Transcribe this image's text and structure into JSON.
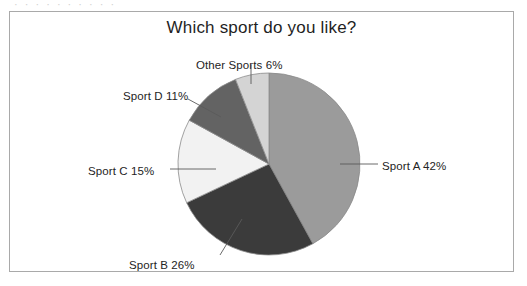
{
  "artifact_text": "· · · · · · · · · ·",
  "figure": {
    "title": "Which sport do you like?",
    "background": "#ffffff",
    "border_color": "#a9a9a9"
  },
  "labels": {
    "sport_a": "Sport A 42%",
    "sport_b": "Sport B 26%",
    "sport_c": "Sport C 15%",
    "sport_d": "Sport D 11%",
    "other_sports": "Other Sports 6%"
  },
  "chart_data": {
    "type": "pie",
    "title": "Which sport do you like?",
    "xlabel": "",
    "ylabel": "",
    "units": "percent",
    "total": 100,
    "start_angle_deg": 0,
    "direction": "clockwise",
    "legend": "none-labels-outside",
    "grid": false,
    "categories": [
      "Sport A",
      "Sport B",
      "Sport C",
      "Sport D",
      "Other Sports"
    ],
    "values": [
      42,
      26,
      15,
      11,
      6
    ],
    "data_labels": [
      "Sport A 42%",
      "Sport B 26%",
      "Sport C 15%",
      "Sport D 11%",
      "Other Sports 6%"
    ],
    "colors": [
      "#9b9b9b",
      "#3b3b3b",
      "#f2f2f2",
      "#636363",
      "#d4d4d4"
    ],
    "slice_edge_color": "#8a8a8a",
    "slices": [
      {
        "name": "Sport A",
        "value": 42,
        "label": "Sport A 42%",
        "color": "#9b9b9b",
        "start_deg": 0,
        "end_deg": 151.2
      },
      {
        "name": "Sport B",
        "value": 26,
        "label": "Sport B 26%",
        "color": "#3b3b3b",
        "start_deg": 151.2,
        "end_deg": 244.8
      },
      {
        "name": "Sport C",
        "value": 15,
        "label": "Sport C 15%",
        "color": "#f2f2f2",
        "start_deg": 244.8,
        "end_deg": 298.8
      },
      {
        "name": "Sport D",
        "value": 11,
        "label": "Sport D 11%",
        "color": "#636363",
        "start_deg": 298.8,
        "end_deg": 338.4
      },
      {
        "name": "Other Sports",
        "value": 6,
        "label": "Other Sports 6%",
        "color": "#d4d4d4",
        "start_deg": 338.4,
        "end_deg": 360
      }
    ]
  }
}
